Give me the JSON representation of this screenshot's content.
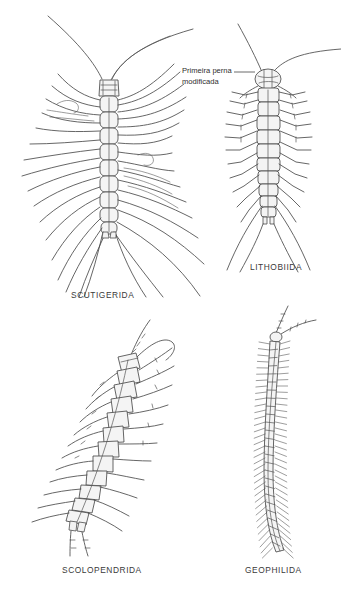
{
  "plate": {
    "title": "Chilopoda orders comparative plate",
    "background_color": "#ffffff",
    "ink_color": "#3a3a3a",
    "fill_color": "#f2f2f2",
    "width": 341,
    "height": 594
  },
  "annotation": {
    "line1": "Primeira perna",
    "line2": "modificada",
    "leader_target": "lithobiida-head"
  },
  "figures": [
    {
      "id": "scutigerida",
      "label": "SCUTIGERIDA",
      "description": "house centipede, long slender sweeping legs, 15 pairs",
      "leg_pairs": 15,
      "position": "top-left"
    },
    {
      "id": "lithobiida",
      "label": "LITHOBIIDA",
      "description": "stone centipede, compact body with jointed legs",
      "leg_pairs": 15,
      "position": "top-right"
    },
    {
      "id": "scolopendrida",
      "label": "SCOLOPENDRIDA",
      "description": "giant centipede, curved body with robust legs",
      "leg_pairs": 21,
      "position": "bottom-left"
    },
    {
      "id": "geophilida",
      "label": "GEOPHILIDA",
      "description": "soil centipede, elongated worm-like with many short legs",
      "leg_pairs": 55,
      "position": "bottom-right"
    }
  ]
}
